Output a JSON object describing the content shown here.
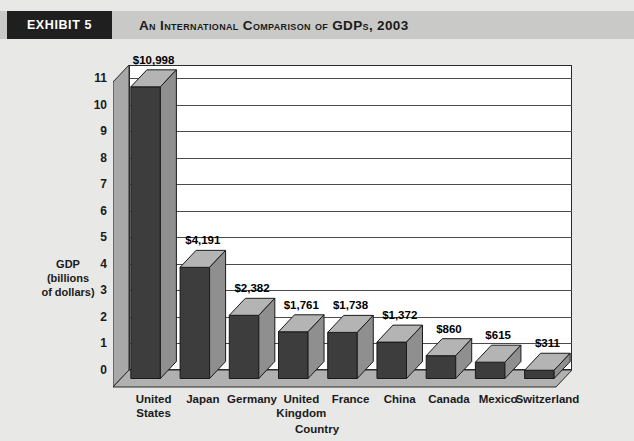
{
  "exhibit": {
    "tag": "EXHIBIT 5",
    "title": "An International Comparison of GDPs, 2003"
  },
  "colors": {
    "page_background": "#e8e8e6",
    "banner": "#c9c9c7",
    "tag_background": "#1f1f1f",
    "tag_text": "#ffffff",
    "plot_background": "#ffffff",
    "bar_front": "#3d3d3d",
    "bar_top": "#b4b4b4",
    "bar_side": "#8f8f8f",
    "wall_left": "#a8a8a8",
    "floor": "#b0b0b0",
    "gridline": "#4a4a4a",
    "axis": "#1a1a1a"
  },
  "chart_data": {
    "type": "bar",
    "title": "An International Comparison of GDPs, 2003",
    "xlabel": "Country",
    "ylabel": "GDP (billions of dollars)",
    "ylabel_lines": [
      "GDP",
      "(billions",
      "of dollars)"
    ],
    "ylim": [
      0,
      11.5
    ],
    "yticks": [
      0,
      1,
      2,
      3,
      4,
      5,
      6,
      7,
      8,
      9,
      10,
      11
    ],
    "ytick_labels": [
      "0",
      "1",
      "2",
      "3",
      "4",
      "5",
      "6",
      "7",
      "8",
      "9",
      "10",
      "11"
    ],
    "y_unit": "thousands of billions of dollars",
    "grid": true,
    "legend": false,
    "three_d": true,
    "categories": [
      "United States",
      "Japan",
      "Germany",
      "United Kingdom",
      "France",
      "China",
      "Canada",
      "Mexico",
      "Switzerland"
    ],
    "category_label_lines": [
      [
        "United",
        "States"
      ],
      [
        "Japan"
      ],
      [
        "Germany"
      ],
      [
        "United",
        "Kingdom"
      ],
      [
        "France"
      ],
      [
        "China"
      ],
      [
        "Canada"
      ],
      [
        "Mexico"
      ],
      [
        "Switzerland"
      ]
    ],
    "values": [
      10998,
      4191,
      2382,
      1761,
      1738,
      1372,
      860,
      615,
      311
    ],
    "value_labels": [
      "$10,998",
      "$4,191",
      "$2,382",
      "$1,761",
      "$1,738",
      "$1,372",
      "$860",
      "$615",
      "$311"
    ]
  }
}
